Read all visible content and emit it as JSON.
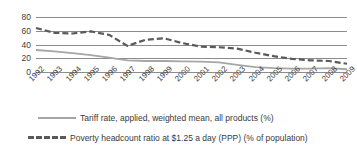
{
  "chart_data": {
    "type": "line",
    "title": "",
    "xlabel": "",
    "ylabel": "",
    "ylim": [
      0,
      80
    ],
    "yticks": [
      0,
      20,
      40,
      60,
      80
    ],
    "grid": true,
    "legend_position": "bottom",
    "categories": [
      "1992",
      "1993",
      "1994",
      "1995",
      "1996",
      "1997",
      "1998",
      "1999",
      "2000",
      "2001",
      "2002",
      "2003",
      "2004",
      "2005",
      "2006",
      "2007",
      "2008",
      "2009"
    ],
    "series": [
      {
        "name": "Tariff rate, applied, weighted mean, all products (%)",
        "style": "solid",
        "color": "#a6a6a6",
        "values": [
          32,
          30,
          27.5,
          24.5,
          21,
          17,
          16,
          16,
          15.5,
          15,
          14,
          10.5,
          7,
          5.5,
          5,
          5,
          5.5,
          4
        ]
      },
      {
        "name": "Poverty headcount ratio at $1.25 a day (PPP) (% of population)",
        "style": "dashed",
        "color": "#5a5a5a",
        "values": [
          64,
          57,
          56,
          59,
          54,
          38,
          47,
          49,
          42,
          37,
          36,
          34,
          28,
          23,
          19,
          17,
          16,
          12
        ]
      }
    ]
  },
  "axis": {
    "ytick_labels": [
      "80",
      "60",
      "40",
      "20",
      "0"
    ],
    "xtick_labels": [
      "1992",
      "1993",
      "1994",
      "1995",
      "1996",
      "1997",
      "1998",
      "1999",
      "2000",
      "2001",
      "2002",
      "2003",
      "2004",
      "2005",
      "2006",
      "2007",
      "2008",
      "2009"
    ]
  },
  "legend": {
    "items": [
      {
        "label": "Tariff rate, applied, weighted mean, all products (%)",
        "style": "solid"
      },
      {
        "label": "Poverty headcount ratio at $1.25 a day (PPP) (% of population)",
        "style": "dashed"
      }
    ]
  },
  "colors": {
    "series_solid": "#a6a6a6",
    "series_dashed": "#5a5a5a",
    "gridline": "#8c8c8c",
    "text": "#404040",
    "background": "#ffffff"
  }
}
